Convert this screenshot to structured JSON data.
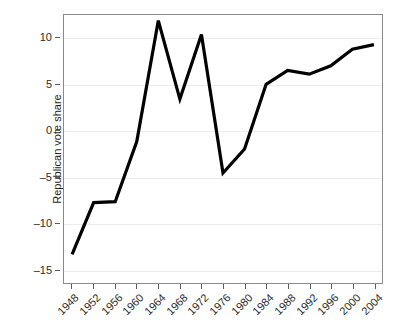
{
  "chart_data": {
    "type": "line",
    "title": "",
    "xlabel": "",
    "ylabel": "Republican vote share",
    "x": [
      1948,
      1952,
      1956,
      1960,
      1964,
      1968,
      1972,
      1976,
      1980,
      1984,
      1988,
      1992,
      1996,
      2000,
      2004
    ],
    "xtick_labels": [
      "1948",
      "1952",
      "1956",
      "1960",
      "1964",
      "1968",
      "1972",
      "1976",
      "1980",
      "1984",
      "1988",
      "1992",
      "1996",
      "2000",
      "2004"
    ],
    "values": [
      -13.4,
      -7.8,
      -7.7,
      -1.2,
      11.9,
      3.4,
      10.4,
      -4.6,
      -2.0,
      5.0,
      6.5,
      6.1,
      7.0,
      8.8,
      9.3
    ],
    "series": [
      {
        "name": "Republican vote share",
        "values": [
          -13.4,
          -7.8,
          -7.7,
          -1.2,
          11.9,
          3.4,
          10.4,
          -4.6,
          -2.0,
          5.0,
          6.5,
          6.1,
          7.0,
          8.8,
          9.3
        ],
        "color": "#000000"
      }
    ],
    "ytick_labels": [
      "10",
      "5",
      "0",
      "–5",
      "–10",
      "–15"
    ],
    "ytick_values": [
      10,
      5,
      0,
      -5,
      -10,
      -15
    ],
    "ylim": [
      -16.5,
      12.5
    ],
    "xlim": [
      1946.5,
      2005.5
    ],
    "grid": true,
    "legend": "none",
    "line_color": "#000000",
    "grid_color": "#ececed",
    "frame_color": "#8a8a8a"
  }
}
